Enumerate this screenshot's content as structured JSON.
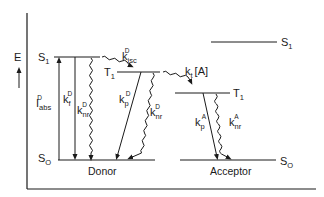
{
  "diagram": {
    "type": "jablonski-energy-level-diagram",
    "axis": {
      "label": "E",
      "direction": "up"
    },
    "donor": {
      "caption": "Donor",
      "levels": {
        "S1": "S",
        "S1_sub": "1",
        "T1": "T",
        "T1_sub": "1",
        "S0": "S",
        "S0_sub": "O"
      },
      "transitions": [
        {
          "name": "absorption",
          "main": "I",
          "sub": "abs",
          "sup": "D",
          "style": "straight-arrow-up"
        },
        {
          "name": "fluorescence",
          "main": "k",
          "sub": "f",
          "sup": "D",
          "style": "straight-arrow-down"
        },
        {
          "name": "nonradiative-singlet",
          "main": "k",
          "sub": "nr",
          "sup": "D",
          "style": "wavy-arrow-down"
        },
        {
          "name": "intersystem-crossing",
          "main": "k",
          "sub": "isc",
          "sup": "D",
          "style": "wavy-arrow"
        },
        {
          "name": "phosphorescence",
          "main": "k",
          "sub": "p",
          "sup": "D",
          "style": "straight-arrow-down"
        },
        {
          "name": "nonradiative-triplet",
          "main": "k",
          "sub": "nr",
          "sup": "D",
          "style": "wavy-arrow-down"
        }
      ]
    },
    "transfer": {
      "main": "k",
      "sub": "t",
      "bracket": "[A]",
      "style": "wavy-arrow"
    },
    "acceptor": {
      "caption": "Acceptor",
      "levels": {
        "S1": "S",
        "S1_sub": "1",
        "T1": "T",
        "T1_sub": "1",
        "S0": "S",
        "S0_sub": "O"
      },
      "transitions": [
        {
          "name": "phosphorescence",
          "main": "k",
          "sub": "p",
          "sup": "A",
          "style": "straight-arrow-down"
        },
        {
          "name": "nonradiative-triplet",
          "main": "k",
          "sub": "nr",
          "sup": "A",
          "style": "wavy-arrow-down"
        }
      ]
    }
  }
}
